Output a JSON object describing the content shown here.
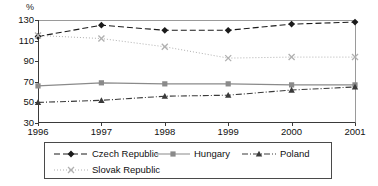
{
  "chart_data": {
    "type": "line",
    "title": "",
    "subtitle": "",
    "xlabel": "",
    "ylabel": "%",
    "unit_label": "%",
    "categories": [
      "1996",
      "1997",
      "1998",
      "1999",
      "2000",
      "2001"
    ],
    "x": [
      1996,
      1997,
      1998,
      1999,
      2000,
      2001
    ],
    "xlim": [
      1996,
      2001
    ],
    "ylim": [
      30,
      130
    ],
    "yticks": [
      30,
      50,
      70,
      90,
      110,
      130
    ],
    "xticks": [
      "1996",
      "1997",
      "1998",
      "1999",
      "2000",
      "2001"
    ],
    "grid": false,
    "legend_position": "bottom",
    "series": [
      {
        "name": "Czech Republic",
        "values": [
          114,
          125,
          120,
          120,
          126,
          128
        ],
        "marker": "diamond",
        "line_style": "dashed",
        "color": "#1a1a1a"
      },
      {
        "name": "Hungary",
        "values": [
          66,
          69,
          68,
          68,
          67,
          67
        ],
        "marker": "square",
        "line_style": "solid",
        "color": "#8a8a8a"
      },
      {
        "name": "Poland",
        "values": [
          50,
          52,
          56,
          57,
          62,
          65
        ],
        "marker": "triangle",
        "line_style": "dash-dot",
        "color": "#3a3a3a"
      },
      {
        "name": "Slovak Republic",
        "values": [
          115,
          112,
          104,
          93,
          94,
          94
        ],
        "marker": "x",
        "line_style": "dotted",
        "color": "#b0b0b0"
      }
    ]
  },
  "legend": {
    "entries": [
      {
        "label": "Czech Republic"
      },
      {
        "label": "Hungary"
      },
      {
        "label": "Poland"
      },
      {
        "label": "Slovak Republic"
      }
    ]
  }
}
